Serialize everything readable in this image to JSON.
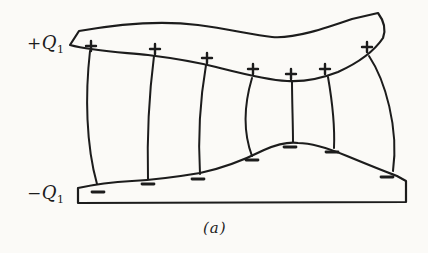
{
  "figure": {
    "caption": "(a)",
    "background_color": "#fbfaf7",
    "line_color": "#1c1c1c",
    "labels": {
      "top_charge": {
        "sign": "+",
        "symbol": "Q",
        "subscript": "1"
      },
      "bottom_charge": {
        "sign": "−",
        "symbol": "Q",
        "subscript": "1"
      }
    },
    "charges": {
      "plus_glyph": "+",
      "minus_glyph": "−",
      "plus_positions": [
        {
          "x": 91,
          "y": 46
        },
        {
          "x": 155,
          "y": 49
        },
        {
          "x": 207,
          "y": 58
        },
        {
          "x": 253,
          "y": 69
        },
        {
          "x": 291,
          "y": 74
        },
        {
          "x": 325,
          "y": 69
        },
        {
          "x": 367,
          "y": 47
        }
      ],
      "minus_positions": [
        {
          "x": 98,
          "y": 192
        },
        {
          "x": 148,
          "y": 184
        },
        {
          "x": 198,
          "y": 179
        },
        {
          "x": 252,
          "y": 160
        },
        {
          "x": 290,
          "y": 147
        },
        {
          "x": 332,
          "y": 152
        },
        {
          "x": 387,
          "y": 177
        }
      ]
    },
    "field_line_count": 7
  }
}
